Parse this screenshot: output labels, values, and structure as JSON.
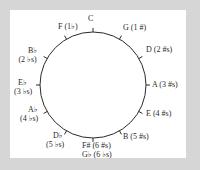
{
  "diagram": {
    "colors": {
      "frame": "#d6d6d6",
      "panel": "#ffffff",
      "line": "#2a2a2a",
      "text": "#2a2a2a"
    },
    "circle": {
      "cx": 93,
      "cy": 85,
      "r": 53
    },
    "keys": [
      {
        "id": "c",
        "angle": 0,
        "line1": "C",
        "line2": ""
      },
      {
        "id": "g",
        "angle": 30,
        "line1": "G (1 #)",
        "line2": ""
      },
      {
        "id": "d",
        "angle": 60,
        "line1": "D (2 #s)",
        "line2": ""
      },
      {
        "id": "a",
        "angle": 90,
        "line1": "A (3 #s)",
        "line2": ""
      },
      {
        "id": "e",
        "angle": 120,
        "line1": "E (4 #s)",
        "line2": ""
      },
      {
        "id": "b",
        "angle": 150,
        "line1": "B (5 #s)",
        "line2": ""
      },
      {
        "id": "fsharp",
        "angle": 180,
        "line1": "F# (6 #s)",
        "line2": "G♭ (6 ♭s)"
      },
      {
        "id": "dflat",
        "angle": 210,
        "line1": "D♭",
        "line2": "(5 ♭s)"
      },
      {
        "id": "aflat",
        "angle": 240,
        "line1": "A♭",
        "line2": "(4 ♭s)"
      },
      {
        "id": "eflat",
        "angle": 270,
        "line1": "E♭",
        "line2": "(3 ♭s)"
      },
      {
        "id": "bflat",
        "angle": 300,
        "line1": "B♭",
        "line2": "(2 ♭s)"
      },
      {
        "id": "f",
        "angle": 330,
        "line1": "F (1♭)",
        "line2": ""
      }
    ]
  }
}
